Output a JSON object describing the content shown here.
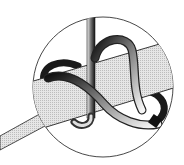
{
  "illustration": {
    "subject": "knot-detail",
    "colors": {
      "background": "#ffffff",
      "outline": "#222222",
      "strap_fill": "#d9d9d9",
      "cord_dark": "#1a1a1a",
      "cord_light": "#f0f0f0"
    },
    "magnifier": {
      "cx": 103,
      "cy": 87,
      "r": 70
    }
  }
}
